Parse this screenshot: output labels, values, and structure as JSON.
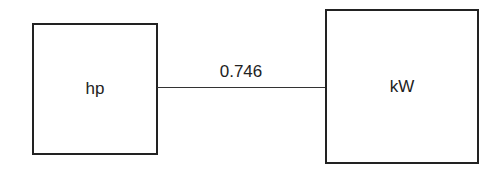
{
  "diagram": {
    "nodes": [
      {
        "id": "hp",
        "label": "hp"
      },
      {
        "id": "kw",
        "label": "kW"
      }
    ],
    "edges": [
      {
        "from": "hp",
        "to": "kw",
        "label": "0.746"
      }
    ]
  }
}
